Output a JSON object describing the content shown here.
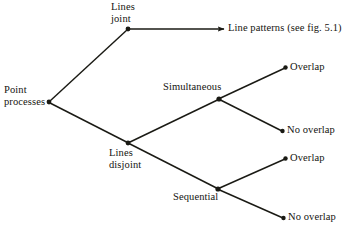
{
  "diagram": {
    "type": "tree",
    "background_color": "#ffffff",
    "line_color": "#1a1a14",
    "text_color": "#14140f",
    "nodes": {
      "root": {
        "label": "Point\nprocesses",
        "x": 49,
        "y": 102
      },
      "lines_joint": {
        "label": "Lines\njoint",
        "x": 128,
        "y": 29
      },
      "lines_disjoint": {
        "label": "Lines\ndisjoint",
        "x": 128,
        "y": 143
      },
      "simultaneous": {
        "label": "Simultaneous",
        "x": 219,
        "y": 99
      },
      "sequential": {
        "label": "Sequential",
        "x": 218,
        "y": 189
      },
      "line_patterns": {
        "label": "Line patterns (see fig. 5.1)",
        "x": 224,
        "y": 29
      },
      "overlap_simultaneous": {
        "label": "Overlap",
        "x": 285,
        "y": 68
      },
      "no_overlap_simultaneous": {
        "label": "No overlap",
        "x": 282,
        "y": 131
      },
      "overlap_sequential": {
        "label": "Overlap",
        "x": 285,
        "y": 159
      },
      "no_overlap_sequential": {
        "label": "No overlap",
        "x": 283,
        "y": 218
      }
    },
    "edges": [
      {
        "from": "root",
        "to": "lines_joint",
        "arrow": false
      },
      {
        "from": "root",
        "to": "lines_disjoint",
        "arrow": false
      },
      {
        "from": "lines_joint",
        "to": "line_patterns",
        "arrow": true
      },
      {
        "from": "lines_disjoint",
        "to": "simultaneous",
        "arrow": false
      },
      {
        "from": "lines_disjoint",
        "to": "sequential",
        "arrow": false
      },
      {
        "from": "simultaneous",
        "to": "overlap_simultaneous",
        "arrow": false
      },
      {
        "from": "simultaneous",
        "to": "no_overlap_simultaneous",
        "arrow": false
      },
      {
        "from": "sequential",
        "to": "overlap_sequential",
        "arrow": false
      },
      {
        "from": "sequential",
        "to": "no_overlap_sequential",
        "arrow": false
      }
    ]
  }
}
